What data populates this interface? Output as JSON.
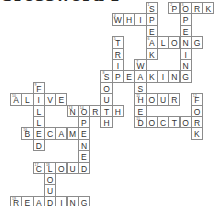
{
  "title": "Crossword Puzzle",
  "grid": {
    "origin_x": 10,
    "origin_y": 2,
    "cell_w": 11.3,
    "cell_h": 11.4,
    "border_color": "#8c8c8c",
    "letter_color": "#333333"
  },
  "words": [
    {
      "word": "SPEAK",
      "direction": "down",
      "row": 0,
      "col": 12,
      "number": "1"
    },
    {
      "word": "PORK",
      "direction": "across",
      "row": 0,
      "col": 14,
      "number": "2"
    },
    {
      "word": "OPENING",
      "direction": "down",
      "row": 0,
      "col": 15,
      "number": "3"
    },
    {
      "word": "WHIP",
      "direction": "across",
      "row": 1,
      "col": 9,
      "number": "4"
    },
    {
      "word": "TRIP",
      "direction": "down",
      "row": 3,
      "col": 9,
      "number": "5"
    },
    {
      "word": "ALONG",
      "direction": "across",
      "row": 3,
      "col": 12,
      "number": "6"
    },
    {
      "word": "WASHED",
      "direction": "down",
      "row": 5,
      "col": 11,
      "number": "7"
    },
    {
      "word": "SPEAKING",
      "direction": "across",
      "row": 6,
      "col": 8,
      "number": "8"
    },
    {
      "word": "SOUTH",
      "direction": "down",
      "row": 6,
      "col": 8,
      "number": "8"
    },
    {
      "word": "FILLED",
      "direction": "down",
      "row": 7,
      "col": 2,
      "number": "9"
    },
    {
      "word": "ALIVE",
      "direction": "across",
      "row": 8,
      "col": 0,
      "number": "10"
    },
    {
      "word": "HOUR",
      "direction": "across",
      "row": 8,
      "col": 11,
      "number": "11"
    },
    {
      "word": "FORK",
      "direction": "down",
      "row": 8,
      "col": 16,
      "number": "12"
    },
    {
      "word": "NORTH",
      "direction": "across",
      "row": 9,
      "col": 5,
      "number": "13"
    },
    {
      "word": "OPENED",
      "direction": "down",
      "row": 9,
      "col": 6,
      "number": "14"
    },
    {
      "word": "DOCTOR",
      "direction": "across",
      "row": 10,
      "col": 11,
      "number": "15"
    },
    {
      "word": "BECAME",
      "direction": "across",
      "row": 11,
      "col": 1,
      "number": "16"
    },
    {
      "word": "CLOUD",
      "direction": "across",
      "row": 14,
      "col": 2,
      "number": "17"
    },
    {
      "word": "LOUD",
      "direction": "down",
      "row": 14,
      "col": 3,
      "number": "18"
    },
    {
      "word": "READING",
      "direction": "across",
      "row": 17,
      "col": 0,
      "number": "19"
    }
  ]
}
